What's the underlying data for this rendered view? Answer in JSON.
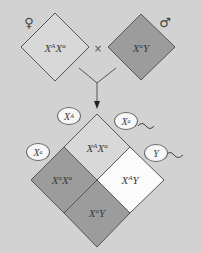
{
  "diagram": {
    "type": "x-linked-inheritance-punnett-square",
    "colors": {
      "background": "#d2d2d2",
      "white_cell": "#fbfbfb",
      "light_cell": "#d8d8d8",
      "dark_cell": "#9c9c9c",
      "outline": "#555555"
    },
    "parents": {
      "female": {
        "symbol": "♀",
        "genotype_base": "X",
        "allele1": "A",
        "base2": "X",
        "allele2": "a"
      },
      "cross_symbol": "×",
      "male": {
        "symbol": "♂",
        "genotype_base": "X",
        "allele1": "a",
        "base2": "Y"
      }
    },
    "gametes": {
      "female": [
        {
          "base": "X",
          "allele": "A"
        },
        {
          "base": "X",
          "allele": "a"
        }
      ],
      "male": [
        {
          "base": "X",
          "allele": "a",
          "has_tail": true
        },
        {
          "base": "Y",
          "allele": "",
          "has_tail": true
        }
      ]
    },
    "offspring": [
      {
        "position": "top",
        "b1": "X",
        "a1": "A",
        "b2": "X",
        "a2": "a",
        "shade": "light"
      },
      {
        "position": "left",
        "b1": "X",
        "a1": "a",
        "b2": "X",
        "a2": "a",
        "shade": "dark"
      },
      {
        "position": "right",
        "b1": "X",
        "a1": "A",
        "b2": "Y",
        "a2": "",
        "shade": "white"
      },
      {
        "position": "bottom",
        "b1": "X",
        "a1": "a",
        "b2": "Y",
        "a2": "",
        "shade": "dark"
      }
    ]
  }
}
